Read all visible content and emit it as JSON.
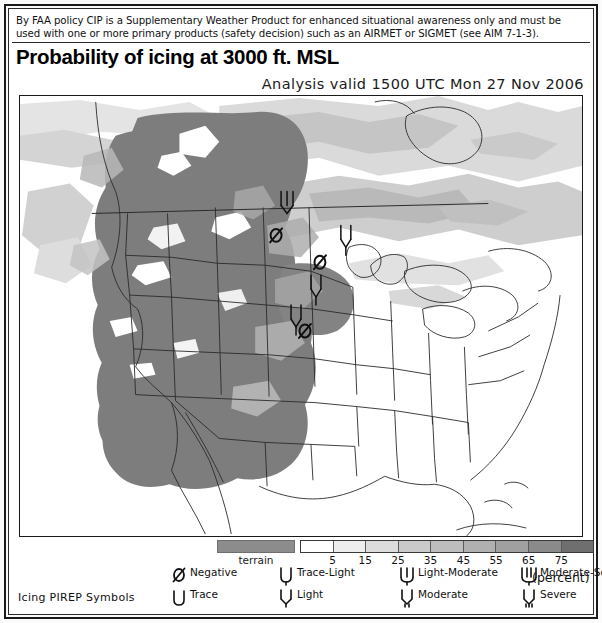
{
  "disclaimer": {
    "line1": "By FAA policy CIP is a Supplementary Weather Product for enhanced situational awareness only and must be",
    "line2": "used with one or more primary products (safety decision) such as an AIRMET or SIGMET (see AIM 7-1-3)."
  },
  "title": "Probability of icing at 3000 ft. MSL",
  "valid_time": "Analysis valid 1500 UTC Mon 27 Nov 2006",
  "legend": {
    "terrain_label": "terrain",
    "terrain_color": "#8c8c8c",
    "percent_label": "(percent)",
    "pirep_title": "Icing PIREP Symbols",
    "colorbar": {
      "tick_labels": [
        "5",
        "15",
        "25",
        "35",
        "45",
        "55",
        "65",
        "75"
      ],
      "tick_positions_pct": [
        11.1,
        22.2,
        33.3,
        44.4,
        55.6,
        66.7,
        77.8,
        88.9
      ],
      "colors": [
        "#ffffff",
        "#ededed",
        "#dcdcdc",
        "#cacaca",
        "#bdbdbd",
        "#b0b0b0",
        "#a0a0a0",
        "#8a8a8a",
        "#6f6f6f"
      ]
    },
    "pirep_items": [
      {
        "id": "negative",
        "label": "Negative",
        "glyph": "negative-slash"
      },
      {
        "id": "trace",
        "label": "Trace",
        "glyph": "trace-cup"
      },
      {
        "id": "trace-light",
        "label": "Trace-Light",
        "glyph": "trace-light-fork"
      },
      {
        "id": "light",
        "label": "Light",
        "glyph": "light-fork"
      },
      {
        "id": "light-moderate",
        "label": "Light-Moderate",
        "glyph": "light-moderate-fork"
      },
      {
        "id": "moderate",
        "label": "Moderate",
        "glyph": "moderate-fork"
      },
      {
        "id": "moderate-severe",
        "label": "Moderate-Severe",
        "glyph": "moderate-severe-fork"
      },
      {
        "id": "severe",
        "label": "Severe",
        "glyph": "severe-fork"
      }
    ]
  },
  "chart_data": {
    "type": "heatmap",
    "title": "Probability of icing at 3000 ft. MSL",
    "subtitle": "Analysis valid 1500 UTC Mon 27 Nov 2006",
    "colorbar_label": "(percent)",
    "value_range": [
      0,
      85
    ],
    "tick_values": [
      5,
      15,
      25,
      35,
      45,
      55,
      65,
      75
    ],
    "projection": "Lambert conformal, CONUS",
    "legend_position": "bottom",
    "grid": false,
    "overlays": [
      "terrain",
      "state-boundaries",
      "coastlines",
      "icing-pireps"
    ],
    "map_pireps": [
      {
        "x": 287,
        "y": 200,
        "type": "light-moderate",
        "label": "Light-Moderate"
      },
      {
        "x": 277,
        "y": 235,
        "type": "negative",
        "label": "Negative"
      },
      {
        "x": 347,
        "y": 233,
        "type": "light",
        "label": "Light"
      },
      {
        "x": 320,
        "y": 262,
        "type": "negative",
        "label": "Negative"
      },
      {
        "x": 317,
        "y": 281,
        "type": "light",
        "label": "Light"
      },
      {
        "x": 297,
        "y": 310,
        "type": "light",
        "label": "Light"
      },
      {
        "x": 305,
        "y": 328,
        "type": "negative",
        "label": "Negative"
      }
    ]
  }
}
